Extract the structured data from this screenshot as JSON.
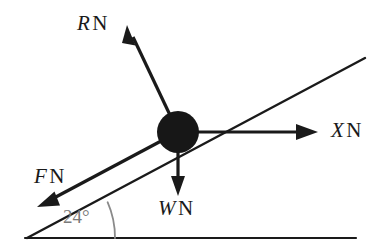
{
  "diagram": {
    "background_color": "#ffffff",
    "stroke_color": "#1a1a1a",
    "angle_color": "#7a7a7a",
    "body": {
      "name": "particle",
      "shape": "filled-circle",
      "center": [
        178,
        132
      ],
      "radius": 21,
      "fill": "#171717"
    },
    "incline": {
      "label": "inclined-plane-line",
      "from": [
        27,
        238
      ],
      "to": [
        365,
        58
      ],
      "angle_degrees": 24
    },
    "ground": {
      "label": "horizontal-ground-line",
      "from": [
        25,
        238
      ],
      "to": [
        356,
        238
      ]
    },
    "angle_marker": {
      "value": "24",
      "degree_symbol": "°",
      "text": "24°",
      "vertex": [
        27,
        238
      ],
      "arc_radius": 88
    },
    "forces": [
      {
        "id": "R",
        "symbol": "R",
        "unit": "N",
        "text": "R N",
        "description": "normal-reaction-force",
        "direction": "up-left perpendicular to incline",
        "tail": [
          178,
          132
        ],
        "tip": [
          127,
          25
        ]
      },
      {
        "id": "X",
        "symbol": "X",
        "unit": "N",
        "text": "X N",
        "description": "applied-horizontal-force",
        "direction": "right horizontal",
        "tail": [
          178,
          132
        ],
        "tip": [
          318,
          132
        ]
      },
      {
        "id": "F",
        "symbol": "F",
        "unit": "N",
        "text": "F N",
        "description": "friction-force",
        "direction": "down-left along incline",
        "tail": [
          178,
          132
        ],
        "tip": [
          37,
          207
        ]
      },
      {
        "id": "W",
        "symbol": "W",
        "unit": "N",
        "text": "W N",
        "description": "weight-force",
        "direction": "down vertical",
        "tail": [
          178,
          132
        ],
        "tip": [
          178,
          196
        ]
      }
    ]
  }
}
